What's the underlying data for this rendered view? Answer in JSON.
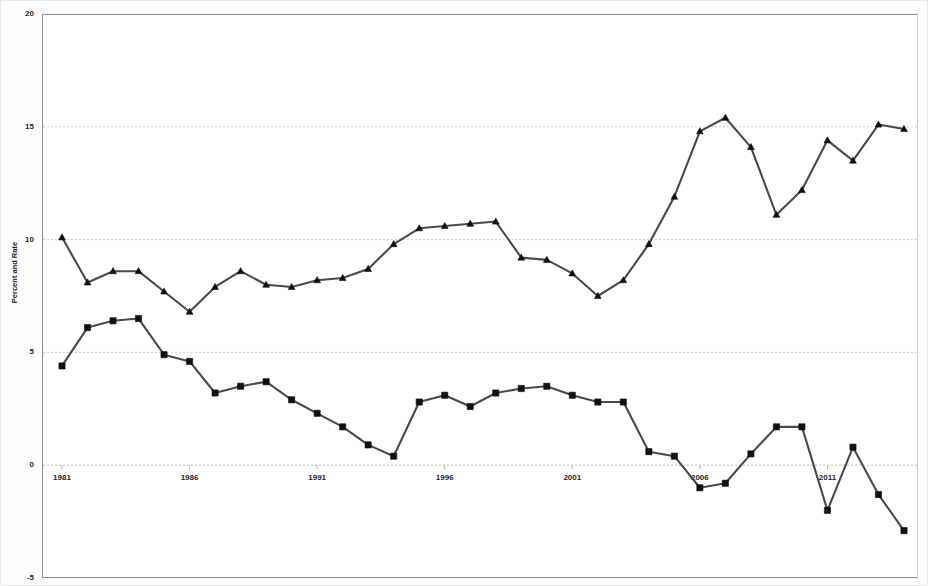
{
  "chart_data": {
    "type": "line",
    "title": "",
    "subtitle": "",
    "xlabel": "",
    "ylabel": "Percent and Rate",
    "xlim": [
      1981,
      2014
    ],
    "ylim": [
      -5,
      20
    ],
    "yticks": [
      20,
      15,
      10,
      5,
      0,
      -5
    ],
    "ytick_labels": [
      "20",
      "15",
      "10",
      "5",
      "0",
      "-5"
    ],
    "xticks": [
      1981,
      1986,
      1991,
      1996,
      2001,
      2006,
      2011
    ],
    "xtick_labels": [
      "1981",
      "1986",
      "1991",
      "1996",
      "2001",
      "2006",
      "2011"
    ],
    "grid": true,
    "grid_axis": "y",
    "legend": "none",
    "x": [
      1981,
      1982,
      1983,
      1984,
      1985,
      1986,
      1987,
      1988,
      1989,
      1990,
      1991,
      1992,
      1993,
      1994,
      1995,
      1996,
      1997,
      1998,
      1999,
      2000,
      2001,
      2002,
      2003,
      2004,
      2005,
      2006,
      2007,
      2008,
      2009,
      2010,
      2011,
      2012,
      2013,
      2014
    ],
    "series": [
      {
        "name": "Upper series",
        "marker": "triangle",
        "color": "#4a4a4a",
        "values": [
          10.1,
          8.1,
          8.6,
          8.6,
          7.7,
          6.8,
          7.9,
          8.6,
          8.0,
          7.9,
          8.2,
          8.3,
          8.7,
          9.8,
          10.5,
          10.6,
          10.7,
          10.8,
          9.2,
          9.1,
          8.5,
          7.5,
          8.2,
          9.8,
          11.9,
          14.8,
          15.4,
          14.1,
          11.1,
          12.2,
          14.4,
          13.5,
          15.1,
          14.9
        ]
      },
      {
        "name": "Lower series",
        "marker": "square",
        "color": "#2b2b2b",
        "values": [
          4.4,
          6.1,
          6.4,
          6.5,
          4.9,
          4.6,
          3.2,
          3.5,
          3.7,
          2.9,
          2.3,
          1.7,
          0.9,
          0.4,
          2.8,
          3.1,
          2.6,
          3.2,
          3.4,
          3.5,
          3.1,
          2.8,
          2.8,
          0.6,
          0.4,
          -1.0,
          -0.8,
          0.5,
          1.7,
          1.7,
          -2.0,
          0.8,
          -1.3,
          -2.9
        ]
      }
    ],
    "series_tail": {
      "note": "",
      "upper_extra": [
        15.1,
        14.9,
        13.7
      ],
      "lower_extra": [
        -1.8,
        -1.2,
        -1.4,
        0.2
      ]
    }
  },
  "axes": {
    "y_title": "Percent and Rate"
  }
}
